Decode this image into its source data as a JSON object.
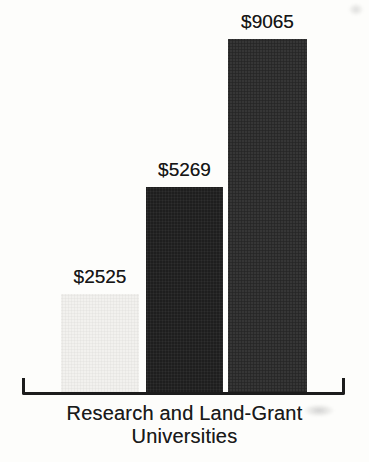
{
  "chart_data": {
    "type": "bar",
    "title": "",
    "categories": [
      "",
      "",
      ""
    ],
    "values": [
      2525,
      5269,
      9065
    ],
    "value_labels": [
      "$2525",
      "$5269",
      "$9065"
    ],
    "xlabel": "Research and Land-Grant Universities",
    "xlabel_lines": [
      "Research and Land-Grant",
      "Universities"
    ],
    "ylabel": "",
    "ylim": [
      0,
      9065
    ],
    "grid": false,
    "legend": "none",
    "bar_colors": [
      "#f2f1ee",
      "#1e1e1e",
      "#363636"
    ],
    "axis_color": "#1c1c1c",
    "text_color": "#1a1a1a",
    "background_color": "#fdfdfb"
  }
}
